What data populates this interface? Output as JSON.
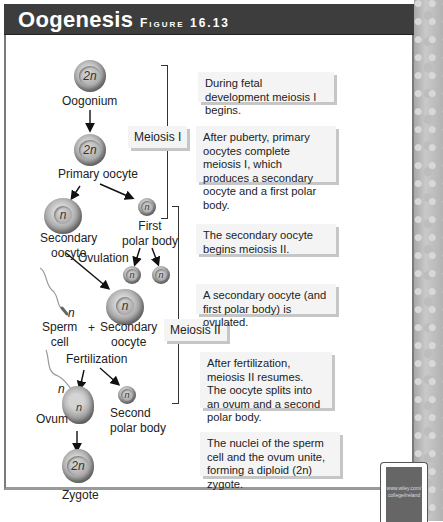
{
  "header": {
    "title": "Oogenesis",
    "figure": "Figure 16.13"
  },
  "cells": {
    "oogonium": {
      "ploidy": "2n",
      "label": "Oogonium"
    },
    "primary_oocyte": {
      "ploidy": "2n",
      "label": "Primary oocyte"
    },
    "secondary_oocyte": {
      "ploidy": "n",
      "label_1": "Secondary",
      "label_2": "oocyte"
    },
    "first_polar_body": {
      "ploidy": "n",
      "label_1": "First",
      "label_2": "polar body"
    },
    "polar_body_a": {
      "ploidy": "n"
    },
    "polar_body_b": {
      "ploidy": "n"
    },
    "ovulated_oocyte": {
      "ploidy": "n",
      "label_1": "Secondary",
      "label_2": "oocyte"
    },
    "sperm": {
      "ploidy": "n",
      "label_1": "Sperm",
      "label_2": "cell"
    },
    "ovum": {
      "ploidy": "n",
      "sperm_ploidy": "n",
      "label": "Ovum"
    },
    "second_polar_body": {
      "ploidy": "n",
      "label_1": "Second",
      "label_2": "polar body"
    },
    "zygote": {
      "ploidy": "2n",
      "label": "Zygote"
    }
  },
  "labels": {
    "ovulation": "Ovulation",
    "plus": "+",
    "fertilization": "Fertilization"
  },
  "stages": {
    "meiosis_1": "Meiosis I",
    "meiosis_2": "Meiosis II"
  },
  "descriptions": [
    "During fetal development meiosis I begins.",
    "After puberty, primary oocytes complete meiosis I, which produces a secondary oocyte and a first polar body.",
    "The secondary oocyte begins meiosis II.",
    "A secondary oocyte (and first polar body) is ovulated.",
    "After fertilization, meiosis II resumes. The oocyte splits into an ovum and a second polar body.",
    "The nuclei of the sperm cell and the ovum unite, forming a diploid (2n) zygote."
  ],
  "web_link": {
    "line_1": "www.wiley.com/",
    "line_2": "college/ireland"
  }
}
